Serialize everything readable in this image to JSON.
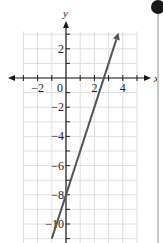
{
  "chart_data": {
    "type": "line",
    "title": "",
    "xlabel": "x",
    "ylabel": "y",
    "xlim": [
      -3,
      5
    ],
    "ylim": [
      -11,
      3.2
    ],
    "grid": true,
    "x_ticks": [
      -2,
      0,
      2,
      4
    ],
    "x_tick_labels": [
      "−2",
      "0",
      "2",
      "4"
    ],
    "y_ticks": [
      2,
      -2,
      -4,
      -6,
      -8,
      -10
    ],
    "y_tick_labels": [
      "2",
      "−2",
      "−4",
      "−6",
      "−8",
      "−10"
    ],
    "series": [
      {
        "name": "y = 3x − 8",
        "equation": "y = 3x - 8",
        "slope": 3,
        "intercept": -8,
        "x": [
          -1.0,
          3.7
        ],
        "y": [
          -11.0,
          3.1
        ],
        "arrow_end": true
      }
    ],
    "colors": {
      "line": "#555555",
      "axis": "#1a1a1a",
      "grid": "#dedede"
    }
  }
}
